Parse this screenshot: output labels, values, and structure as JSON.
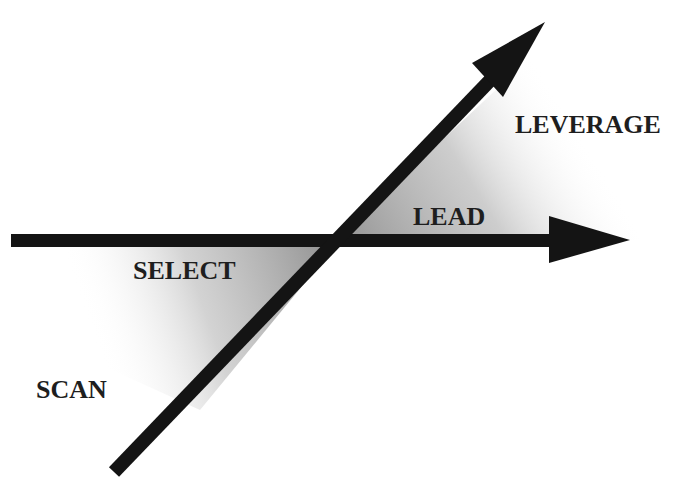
{
  "diagram": {
    "labels": {
      "leverage": "LEVERAGE",
      "lead": "LEAD",
      "select": "SELECT",
      "scan": "SCAN"
    },
    "colors": {
      "arrow": "#141414",
      "shade": "#9a9a9a",
      "background": "#ffffff",
      "text": "#1e1e1e"
    }
  }
}
